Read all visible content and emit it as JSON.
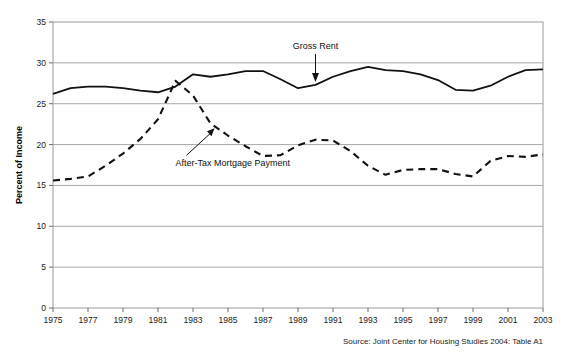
{
  "chart_data": {
    "type": "line",
    "title": "",
    "xlabel": "",
    "ylabel": "Percent of Income",
    "ylim": [
      0,
      35
    ],
    "ytick_step": 5,
    "yticks": [
      "0",
      "5",
      "10",
      "15",
      "20",
      "25",
      "30",
      "35"
    ],
    "xlim": [
      1975,
      2003
    ],
    "xticks": [
      "1975",
      "1977",
      "1979",
      "1981",
      "1983",
      "1985",
      "1987",
      "1989",
      "1991",
      "1993",
      "1995",
      "1997",
      "1999",
      "2001",
      "2003"
    ],
    "x": [
      1975,
      1976,
      1977,
      1978,
      1979,
      1980,
      1981,
      1982,
      1983,
      1984,
      1985,
      1986,
      1987,
      1988,
      1989,
      1990,
      1991,
      1992,
      1993,
      1994,
      1995,
      1996,
      1997,
      1998,
      1999,
      2000,
      2001,
      2002,
      2003
    ],
    "grid": "horizontal",
    "legend_position": "inline-annotations",
    "series": [
      {
        "name": "Gross Rent",
        "style": "solid",
        "color": "#111111",
        "values": [
          26.2,
          26.9,
          27.1,
          27.1,
          26.9,
          26.6,
          26.4,
          27.1,
          28.6,
          28.3,
          28.6,
          29.0,
          29.0,
          28.0,
          26.9,
          27.3,
          28.3,
          29.0,
          29.5,
          29.1,
          29.0,
          28.6,
          27.9,
          26.7,
          26.6,
          27.2,
          28.3,
          29.1,
          29.2
        ]
      },
      {
        "name": "After-Tax Mortgage Payment",
        "style": "dashed",
        "color": "#111111",
        "values": [
          15.6,
          15.8,
          16.1,
          17.4,
          18.9,
          20.7,
          23.1,
          27.8,
          26.0,
          22.6,
          21.1,
          19.8,
          18.6,
          18.7,
          19.9,
          20.6,
          20.5,
          19.2,
          17.4,
          16.3,
          16.9,
          17.0,
          17.0,
          16.4,
          16.1,
          18.0,
          18.6,
          18.5,
          18.8
        ]
      }
    ],
    "annotations": [
      {
        "text": "Gross Rent",
        "target_series": "Gross Rent",
        "arrow": "down"
      },
      {
        "text": "After-Tax Mortgage Payment",
        "target_series": "After-Tax Mortgage Payment",
        "arrow": "up-right"
      }
    ],
    "source": "Source: Joint Center for Housing Studies 2004: Table A1"
  }
}
